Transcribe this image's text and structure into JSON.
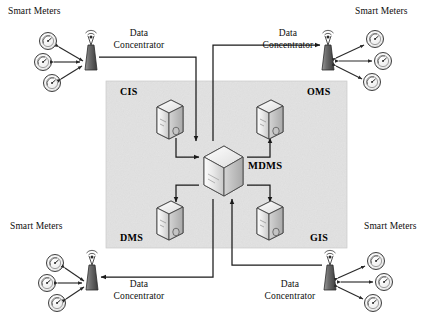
{
  "figure": {
    "panel": {
      "label": "central-systems-panel",
      "fill_color": "#e2e2e2",
      "border_color": "#b9b9b9",
      "x": 106,
      "y": 81,
      "width": 241,
      "height": 167
    },
    "line_color": "#1a1a1a",
    "background_color": "#ffffff"
  },
  "central_node": {
    "id": "mdms",
    "label": "MDMS",
    "icon": "server-box-icon",
    "x": 204,
    "y": 147,
    "width": 38,
    "height": 48
  },
  "systems": [
    {
      "id": "cis",
      "label": "CIS",
      "icon": "server-tower-icon",
      "label_x": 120,
      "label_y": 88,
      "icon_x": 153,
      "icon_y": 100
    },
    {
      "id": "oms",
      "label": "OMS",
      "icon": "server-tower-icon",
      "label_x": 306,
      "label_y": 88,
      "icon_x": 253,
      "icon_y": 100
    },
    {
      "id": "dms",
      "label": "DMS",
      "icon": "server-tower-icon",
      "label_x": 120,
      "label_y": 233,
      "icon_x": 153,
      "icon_y": 196
    },
    {
      "id": "gis",
      "label": "GIS",
      "icon": "server-tower-icon",
      "label_x": 308,
      "label_y": 233,
      "icon_x": 253,
      "icon_y": 196
    }
  ],
  "edge_groups": [
    {
      "id": "top-left",
      "smart_meters_label": "Smart Meters",
      "concentrator_label_line1": "Data",
      "concentrator_label_line2": "Concentrator",
      "concentrator_icon": "antenna-tower-icon",
      "meter_icon": "smart-meter-gauge-icon",
      "meter_count": 3
    },
    {
      "id": "top-right",
      "smart_meters_label": "Smart Meters",
      "concentrator_label_line1": "Data",
      "concentrator_label_line2": "Concentrator",
      "concentrator_icon": "antenna-tower-icon",
      "meter_icon": "smart-meter-gauge-icon",
      "meter_count": 3
    },
    {
      "id": "bottom-left",
      "smart_meters_label": "Smart Meters",
      "concentrator_label_line1": "Data",
      "concentrator_label_line2": "Concentrator",
      "concentrator_icon": "antenna-tower-icon",
      "meter_icon": "smart-meter-gauge-icon",
      "meter_count": 3
    },
    {
      "id": "bottom-right",
      "smart_meters_label": "Smart Meters",
      "concentrator_label_line1": "Data",
      "concentrator_label_line2": "Concentrator",
      "concentrator_icon": "antenna-tower-icon",
      "meter_icon": "smart-meter-gauge-icon",
      "meter_count": 3
    }
  ]
}
